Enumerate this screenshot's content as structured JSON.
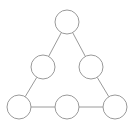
{
  "diagram": {
    "type": "triangle-node-graph",
    "background": "#ffffff",
    "stroke_color": "#9a9a9a",
    "stroke_width": 1,
    "node_radius": 12,
    "nodes": [
      {
        "id": "top",
        "cx": 67,
        "cy": 22
      },
      {
        "id": "mid-left",
        "cx": 43,
        "cy": 67
      },
      {
        "id": "mid-right",
        "cx": 91,
        "cy": 67
      },
      {
        "id": "bottom-left",
        "cx": 19,
        "cy": 107
      },
      {
        "id": "bottom-center",
        "cx": 67,
        "cy": 107
      },
      {
        "id": "bottom-right",
        "cx": 115,
        "cy": 107
      }
    ],
    "edges": [
      [
        "top",
        "mid-left"
      ],
      [
        "top",
        "mid-right"
      ],
      [
        "mid-left",
        "bottom-left"
      ],
      [
        "mid-right",
        "bottom-right"
      ],
      [
        "bottom-left",
        "bottom-center"
      ],
      [
        "bottom-center",
        "bottom-right"
      ]
    ]
  }
}
